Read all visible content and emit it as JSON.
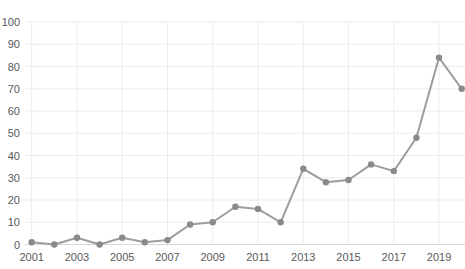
{
  "chart_data": {
    "type": "line",
    "title": "",
    "categories": [
      2001,
      2002,
      2003,
      2004,
      2005,
      2006,
      2007,
      2008,
      2009,
      2010,
      2011,
      2012,
      2013,
      2014,
      2015,
      2016,
      2017,
      2018,
      2019,
      2020
    ],
    "values": [
      1,
      0,
      3,
      0,
      3,
      1,
      2,
      9,
      10,
      17,
      16,
      10,
      34,
      28,
      29,
      36,
      33,
      48,
      84,
      70
    ],
    "x_tick_labels": [
      "2001",
      "2003",
      "2005",
      "2007",
      "2009",
      "2011",
      "2013",
      "2015",
      "2017",
      "2019"
    ],
    "y_tick_labels": [
      "0",
      "10",
      "20",
      "30",
      "40",
      "50",
      "60",
      "70",
      "80",
      "90",
      "100"
    ],
    "ylim": [
      0,
      100
    ],
    "grid": true,
    "legend": "none",
    "marker_style": "circle",
    "colors": {
      "line": "#9d9d9d",
      "marker": "#8a8a8a",
      "gridline": "#ececec",
      "axis_line": "#d9d9d9",
      "tick_text": "#595959",
      "background": "#ffffff"
    }
  }
}
